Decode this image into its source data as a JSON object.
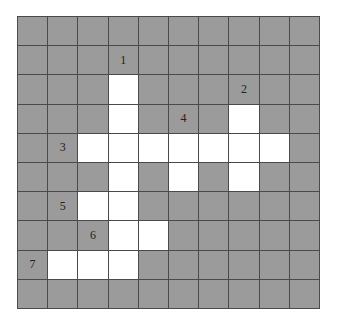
{
  "puzzle": {
    "type": "crossword",
    "rows": 10,
    "cols": 10,
    "colors": {
      "block": "#9b9b9b",
      "open": "#ffffff",
      "line": "#4a4a4a"
    },
    "open_cells": [
      [
        2,
        3
      ],
      [
        3,
        3
      ],
      [
        3,
        7
      ],
      [
        4,
        2
      ],
      [
        4,
        3
      ],
      [
        4,
        4
      ],
      [
        4,
        5
      ],
      [
        4,
        6
      ],
      [
        4,
        7
      ],
      [
        4,
        8
      ],
      [
        5,
        3
      ],
      [
        5,
        5
      ],
      [
        5,
        7
      ],
      [
        6,
        2
      ],
      [
        6,
        3
      ],
      [
        7,
        3
      ],
      [
        7,
        4
      ],
      [
        8,
        1
      ],
      [
        8,
        2
      ],
      [
        8,
        3
      ]
    ],
    "clue_numbers": [
      {
        "num": "1",
        "row": 1,
        "col": 3,
        "direction": "down"
      },
      {
        "num": "2",
        "row": 2,
        "col": 7,
        "direction": "down"
      },
      {
        "num": "3",
        "row": 4,
        "col": 1,
        "direction": "across"
      },
      {
        "num": "4",
        "row": 3,
        "col": 5,
        "direction": "down"
      },
      {
        "num": "5",
        "row": 6,
        "col": 1,
        "direction": "across"
      },
      {
        "num": "6",
        "row": 7,
        "col": 2,
        "direction": "across"
      },
      {
        "num": "7",
        "row": 8,
        "col": 0,
        "direction": "across"
      }
    ]
  }
}
